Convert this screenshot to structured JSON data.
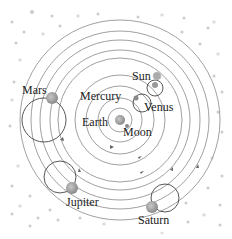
{
  "labels": {
    "sun": "Sun",
    "mercury": "Mercury",
    "venus": "Venus",
    "earth": "Earth",
    "moon": "Moon",
    "mars": "Mars",
    "jupiter": "Jupiter",
    "saturn": "Saturn"
  },
  "colors": {
    "orbit": "#777777",
    "planet": "#9a9a9a",
    "star": "#bbbbbb",
    "text": "#222222"
  }
}
